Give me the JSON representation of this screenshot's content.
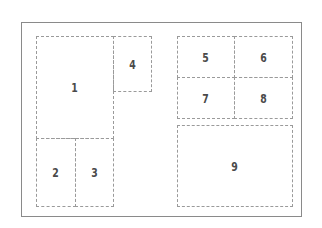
{
  "diagram": {
    "line_color": "#9a9a9a",
    "label_color": "#4a4a4a",
    "panels": [
      {
        "label": "1"
      },
      {
        "label": "2"
      },
      {
        "label": "3"
      },
      {
        "label": "4"
      },
      {
        "label": "5"
      },
      {
        "label": "6"
      },
      {
        "label": "7"
      },
      {
        "label": "8"
      },
      {
        "label": "9"
      }
    ]
  }
}
